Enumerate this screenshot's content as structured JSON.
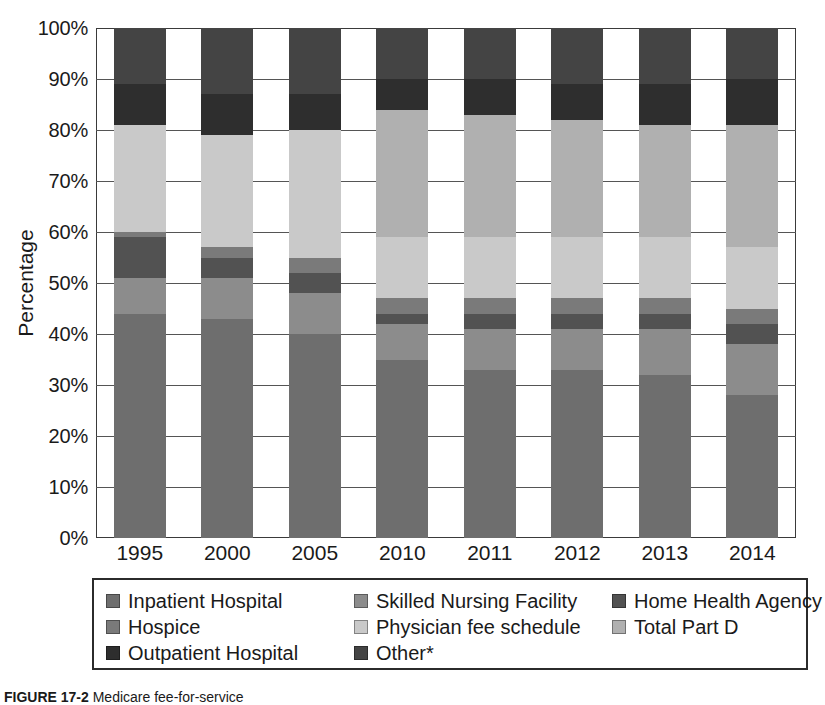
{
  "figure": {
    "caption_label": "FIGURE 17-2",
    "caption_text": "Medicare fee-for-service"
  },
  "axes": {
    "y_title": "Percentage",
    "y_ticks": [
      "0%",
      "10%",
      "20%",
      "30%",
      "40%",
      "50%",
      "60%",
      "70%",
      "80%",
      "90%",
      "100%"
    ],
    "y_min": 0,
    "y_max": 100,
    "x_ticks": [
      "1995",
      "2000",
      "2005",
      "2010",
      "2011",
      "2012",
      "2013",
      "2014"
    ]
  },
  "legend": {
    "items": [
      {
        "label": "Inpatient Hospital",
        "color": "#6e6e6e"
      },
      {
        "label": "Skilled Nursing Facility",
        "color": "#8c8c8c"
      },
      {
        "label": "Home Health Agency",
        "color": "#525252"
      },
      {
        "label": "Hospice",
        "color": "#7a7a7a"
      },
      {
        "label": "Physician fee schedule",
        "color": "#c9c9c9"
      },
      {
        "label": "Total Part D",
        "color": "#b0b0b0"
      },
      {
        "label": "Outpatient Hospital",
        "color": "#2e2e2e"
      },
      {
        "label": "Other*",
        "color": "#444444"
      }
    ]
  },
  "chart_data": {
    "type": "bar",
    "stacked": true,
    "normalized": true,
    "title": "",
    "xlabel": "",
    "ylabel": "Percentage",
    "ylim": [
      0,
      100
    ],
    "grid": true,
    "legend_position": "bottom",
    "categories": [
      "1995",
      "2000",
      "2005",
      "2010",
      "2011",
      "2012",
      "2013",
      "2014"
    ],
    "series": [
      {
        "name": "Inpatient Hospital",
        "color": "#6e6e6e",
        "values": [
          44,
          43,
          40,
          35,
          33,
          33,
          32,
          28
        ]
      },
      {
        "name": "Skilled Nursing Facility",
        "color": "#8c8c8c",
        "values": [
          7,
          8,
          8,
          7,
          8,
          8,
          9,
          10
        ]
      },
      {
        "name": "Home Health Agency",
        "color": "#525252",
        "values": [
          8,
          4,
          4,
          2,
          3,
          3,
          3,
          4
        ]
      },
      {
        "name": "Hospice",
        "color": "#7a7a7a",
        "values": [
          1,
          2,
          3,
          3,
          3,
          3,
          3,
          3
        ]
      },
      {
        "name": "Physician fee schedule",
        "color": "#c9c9c9",
        "values": [
          21,
          22,
          25,
          12,
          12,
          12,
          12,
          12
        ]
      },
      {
        "name": "Total Part D",
        "color": "#b0b0b0",
        "values": [
          0,
          0,
          0,
          25,
          24,
          23,
          22,
          24
        ]
      },
      {
        "name": "Outpatient Hospital",
        "color": "#2e2e2e",
        "values": [
          8,
          8,
          7,
          6,
          7,
          7,
          8,
          9
        ]
      },
      {
        "name": "Other*",
        "color": "#444444",
        "values": [
          11,
          13,
          13,
          10,
          10,
          11,
          11,
          10
        ]
      }
    ]
  }
}
